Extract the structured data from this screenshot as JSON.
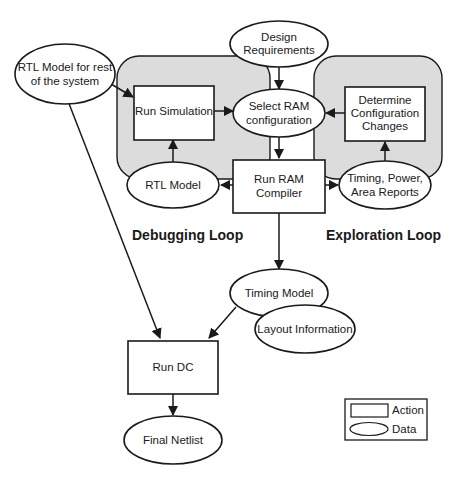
{
  "diagram": {
    "loops": {
      "debugging": {
        "label": "Debugging Loop"
      },
      "exploration": {
        "label": "Exploration Loop"
      }
    },
    "nodes": {
      "rtl_model_rest": {
        "type": "data",
        "lines": [
          "RTL Model for rest",
          "of the system"
        ]
      },
      "design_requirements": {
        "type": "data",
        "lines": [
          "Design",
          "Requirements"
        ]
      },
      "run_simulation": {
        "type": "action",
        "lines": [
          "Run Simulation"
        ]
      },
      "select_ram_config": {
        "type": "data",
        "lines": [
          "Select RAM",
          "configuration"
        ]
      },
      "determine_config_changes": {
        "type": "action",
        "lines": [
          "Determine",
          "Configuration",
          "Changes"
        ]
      },
      "rtl_model": {
        "type": "data",
        "lines": [
          "RTL Model"
        ]
      },
      "run_ram_compiler": {
        "type": "action",
        "lines": [
          "Run RAM",
          "Compiler"
        ]
      },
      "timing_power_area": {
        "type": "data",
        "lines": [
          "Timing, Power,",
          "Area Reports"
        ]
      },
      "timing_model": {
        "type": "data",
        "lines": [
          "Timing Model"
        ]
      },
      "layout_information": {
        "type": "data",
        "lines": [
          "Layout Information"
        ]
      },
      "run_dc": {
        "type": "action",
        "lines": [
          "Run DC"
        ]
      },
      "final_netlist": {
        "type": "data",
        "lines": [
          "Final Netlist"
        ]
      }
    },
    "edges": [
      {
        "from": "rtl_model_rest",
        "to": "run_simulation"
      },
      {
        "from": "rtl_model_rest",
        "to": "run_dc"
      },
      {
        "from": "design_requirements",
        "to": "select_ram_config"
      },
      {
        "from": "run_simulation",
        "to": "select_ram_config"
      },
      {
        "from": "determine_config_changes",
        "to": "select_ram_config"
      },
      {
        "from": "select_ram_config",
        "to": "run_ram_compiler"
      },
      {
        "from": "rtl_model",
        "to": "run_simulation"
      },
      {
        "from": "run_ram_compiler",
        "to": "rtl_model"
      },
      {
        "from": "run_ram_compiler",
        "to": "timing_power_area"
      },
      {
        "from": "timing_power_area",
        "to": "determine_config_changes"
      },
      {
        "from": "run_ram_compiler",
        "to": "timing_model"
      },
      {
        "from": "timing_model",
        "to": "run_dc"
      },
      {
        "from": "run_dc",
        "to": "final_netlist"
      }
    ],
    "legend": {
      "action": "Action",
      "data": "Data"
    }
  }
}
